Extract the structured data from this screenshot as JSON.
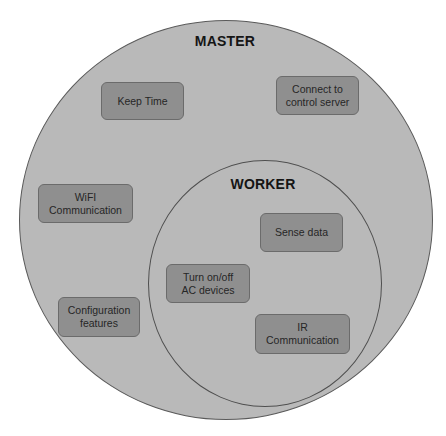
{
  "diagram": {
    "type": "nested-venn",
    "colors": {
      "circle_fill": "#b9b9b9",
      "box_fill": "#8f8f8f",
      "box_border": "#6b6b6b",
      "outline": "#5a5a5a"
    },
    "master": {
      "label": "MASTER",
      "items": [
        {
          "id": "keep-time",
          "lines": [
            "Keep Time"
          ]
        },
        {
          "id": "connect-server",
          "lines": [
            "Connect to",
            "control server"
          ]
        },
        {
          "id": "wifi",
          "lines": [
            "WiFI",
            "Communication"
          ]
        },
        {
          "id": "configuration",
          "lines": [
            "Configuration",
            "features"
          ]
        }
      ]
    },
    "worker": {
      "label": "WORKER",
      "items": [
        {
          "id": "sense-data",
          "lines": [
            "Sense data"
          ]
        },
        {
          "id": "turn-on-off",
          "lines": [
            "Turn on/off",
            "AC devices"
          ]
        },
        {
          "id": "ir",
          "lines": [
            "IR",
            "Communication"
          ]
        }
      ]
    }
  }
}
